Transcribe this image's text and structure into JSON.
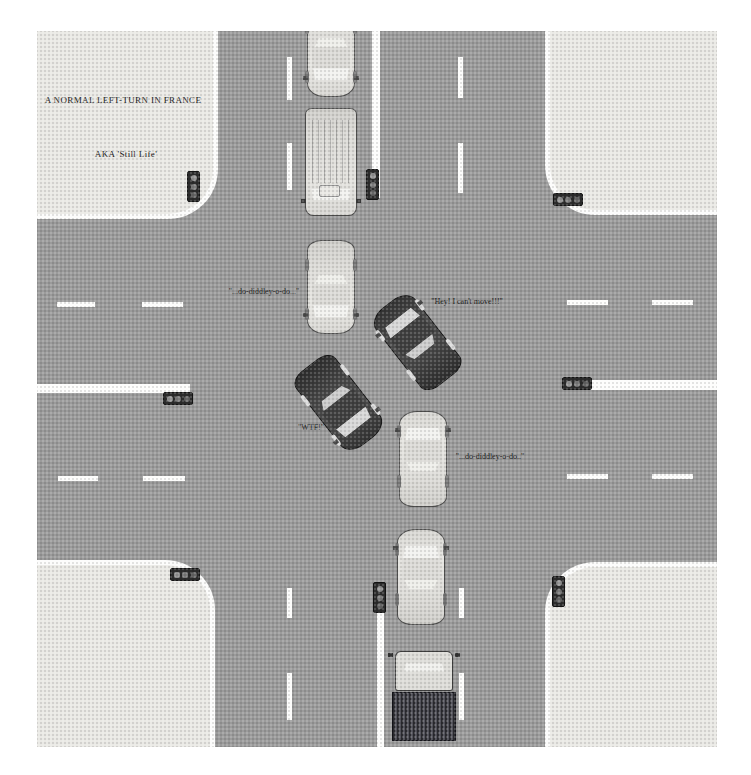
{
  "illustration": {
    "title": "A NORMAL LEFT-TURN IN FRANCE",
    "subtitle": "AKA 'Still Life'"
  },
  "colors": {
    "road": "#9b9b9b",
    "sidewalk": "#eae9e5",
    "lane_marking": "#fdfdfc",
    "car_light_body": "#deddd9",
    "car_dark_body": "#464646",
    "truck_bed": "#45454e",
    "signal_housing": "#2d2d2d"
  },
  "captions": [
    {
      "id": "caption-title",
      "text": "A NORMAL LEFT-TURN IN FRANCE",
      "x": 86,
      "y": 69,
      "style": "title"
    },
    {
      "id": "caption-subtitle",
      "text": "AKA 'Still Life'",
      "x": 89,
      "y": 123,
      "style": "title"
    },
    {
      "id": "caption-diddley-north",
      "text": "\"...do-diddley-o-do...\"",
      "x": 227,
      "y": 260,
      "style": "speech"
    },
    {
      "id": "caption-cant-move",
      "text": "\"Hey! I can't move!!!\"",
      "x": 430,
      "y": 270,
      "style": "speech"
    },
    {
      "id": "caption-wtf",
      "text": "\"WTF!\"",
      "x": 274,
      "y": 396,
      "style": "speech"
    },
    {
      "id": "caption-diddley-south",
      "text": "\"...do-diddley-o-do..\"",
      "x": 453,
      "y": 425,
      "style": "speech"
    }
  ],
  "sidewalks": [
    {
      "id": "sidewalk-top-left",
      "x": 0,
      "y": 0,
      "w": 181,
      "h": 188,
      "corner": "br"
    },
    {
      "id": "sidewalk-top-right",
      "x": 508,
      "y": 0,
      "w": 172,
      "h": 184,
      "corner": "bl"
    },
    {
      "id": "sidewalk-bottom-left",
      "x": 0,
      "y": 529,
      "w": 178,
      "h": 187,
      "corner": "tr"
    },
    {
      "id": "sidewalk-bottom-right",
      "x": 508,
      "y": 531,
      "w": 172,
      "h": 185,
      "corner": "tl"
    }
  ],
  "lane_lines_solid": [
    {
      "id": "center-line-north",
      "x": 335,
      "y": 0,
      "w": 8,
      "h": 167
    },
    {
      "id": "center-line-south",
      "x": 340,
      "y": 581,
      "w": 7,
      "h": 135
    },
    {
      "id": "center-line-west",
      "x": 0,
      "y": 353,
      "w": 153,
      "h": 9
    },
    {
      "id": "center-line-east",
      "x": 551,
      "y": 349,
      "w": 129,
      "h": 10
    }
  ],
  "lane_dashes": [
    {
      "x": 250,
      "y": 26,
      "w": 5,
      "h": 43
    },
    {
      "x": 250,
      "y": 112,
      "w": 5,
      "h": 47
    },
    {
      "x": 421,
      "y": 26,
      "w": 5,
      "h": 41
    },
    {
      "x": 421,
      "y": 112,
      "w": 5,
      "h": 50
    },
    {
      "x": 250,
      "y": 557,
      "w": 5,
      "h": 30
    },
    {
      "x": 250,
      "y": 642,
      "w": 5,
      "h": 47
    },
    {
      "x": 422,
      "y": 557,
      "w": 5,
      "h": 30
    },
    {
      "x": 422,
      "y": 642,
      "w": 5,
      "h": 47
    },
    {
      "x": 20,
      "y": 271,
      "w": 38,
      "h": 5
    },
    {
      "x": 105,
      "y": 271,
      "w": 41,
      "h": 5
    },
    {
      "x": 21,
      "y": 445,
      "w": 40,
      "h": 5
    },
    {
      "x": 106,
      "y": 445,
      "w": 42,
      "h": 5
    },
    {
      "x": 530,
      "y": 269,
      "w": 41,
      "h": 5
    },
    {
      "x": 615,
      "y": 269,
      "w": 41,
      "h": 5
    },
    {
      "x": 530,
      "y": 443,
      "w": 41,
      "h": 5
    },
    {
      "x": 615,
      "y": 443,
      "w": 41,
      "h": 5
    }
  ],
  "traffic_signals": [
    {
      "id": "signal-north-approach",
      "x": 329,
      "y": 138,
      "o": "v"
    },
    {
      "id": "signal-west-approach",
      "x": 126,
      "y": 361,
      "o": "h"
    },
    {
      "id": "signal-east-approach",
      "x": 525,
      "y": 346,
      "o": "h"
    },
    {
      "id": "signal-south-approach",
      "x": 336,
      "y": 551,
      "o": "v"
    },
    {
      "id": "signal-corner-top-left",
      "x": 150,
      "y": 140,
      "o": "v"
    },
    {
      "id": "signal-corner-top-right",
      "x": 516,
      "y": 162,
      "o": "h"
    },
    {
      "id": "signal-corner-bottom-left",
      "x": 133,
      "y": 537,
      "o": "h"
    },
    {
      "id": "signal-corner-bottom-right",
      "x": 515,
      "y": 545,
      "o": "v"
    }
  ],
  "vehicles": [
    {
      "id": "car-southbound-queued-1",
      "kind": "sedan",
      "shade": "light",
      "x": 294,
      "y": 19,
      "w": 48,
      "l": 94,
      "rot": 180
    },
    {
      "id": "van-southbound-queued",
      "kind": "van",
      "shade": "light",
      "x": 294,
      "y": 131,
      "w": 52,
      "l": 108,
      "rot": 180
    },
    {
      "id": "car-southbound-queued-2",
      "kind": "sedan",
      "shade": "light",
      "x": 294,
      "y": 256,
      "w": 48,
      "l": 94,
      "rot": 180
    },
    {
      "id": "car-left-turn-blocked",
      "kind": "sedan",
      "shade": "dark",
      "x": 380,
      "y": 311,
      "w": 50,
      "l": 96,
      "rot": -38
    },
    {
      "id": "car-left-turn-wtf",
      "kind": "sedan",
      "shade": "dark",
      "x": 302,
      "y": 372,
      "w": 50,
      "l": 96,
      "rot": 142
    },
    {
      "id": "car-northbound-queued-1",
      "kind": "sedan",
      "shade": "light",
      "x": 386,
      "y": 428,
      "w": 48,
      "l": 96,
      "rot": 0
    },
    {
      "id": "car-northbound-queued-2",
      "kind": "sedan",
      "shade": "light",
      "x": 384,
      "y": 546,
      "w": 48,
      "l": 96,
      "rot": 0
    },
    {
      "id": "truck-northbound-queued",
      "kind": "truck",
      "shade": "light",
      "x": 387,
      "y": 665,
      "w": 64,
      "l": 90,
      "rot": 0
    }
  ]
}
